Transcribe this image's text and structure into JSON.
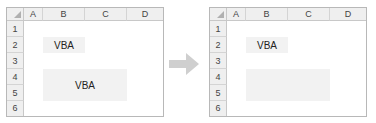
{
  "columns": [
    "A",
    "B",
    "C",
    "D"
  ],
  "rows": [
    "1",
    "2",
    "3",
    "4",
    "5",
    "6"
  ],
  "before": {
    "cells": {
      "B2": "VBA",
      "B4:C5": "VBA"
    }
  },
  "after": {
    "cells": {
      "B2": "VBA",
      "B4:C5": ""
    }
  },
  "arrow": {
    "icon": "right-arrow-icon",
    "color": "#cfcfcf"
  },
  "colors": {
    "fill": "#f2f2f2",
    "header": "#efefef",
    "border": "#b8b8b8"
  }
}
